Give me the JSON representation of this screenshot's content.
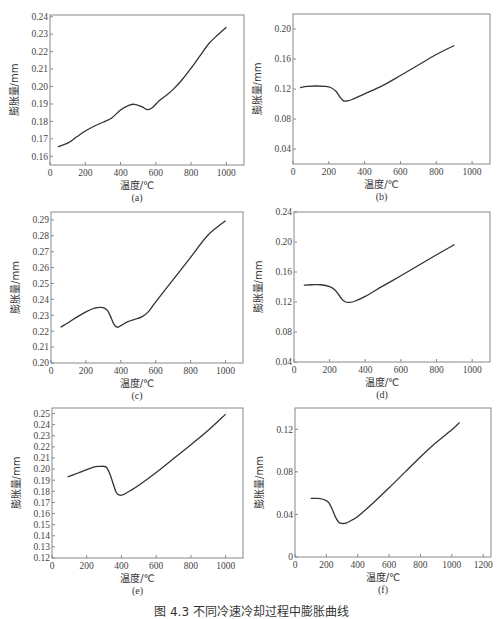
{
  "figure": {
    "caption": "图 4.3  不同冷速冷却过程中膨胀曲线"
  },
  "colors": {
    "line": "#333333",
    "frame": "#888888",
    "text": "#444444"
  },
  "chart_data": [
    {
      "id": "a",
      "type": "line",
      "sublabel": "(a)",
      "xlabel": "温度/℃",
      "ylabel": "膨胀量/mm",
      "xlim": [
        0,
        1100
      ],
      "ylim": [
        0.155,
        0.241
      ],
      "xticks": [
        0,
        200,
        400,
        600,
        800,
        1000
      ],
      "yticks": [
        0.16,
        0.17,
        0.18,
        0.19,
        0.2,
        0.21,
        0.22,
        0.23,
        0.24
      ],
      "ytick_labels": [
        "0.16",
        "0.17",
        "0.18",
        "0.19",
        "0.20",
        "0.21",
        "0.22",
        "0.23",
        "0.24"
      ],
      "frame": {
        "x": 50,
        "y": 15,
        "w": 194,
        "h": 150
      },
      "x": [
        45,
        100,
        150,
        200,
        250,
        300,
        350,
        400,
        450,
        480,
        520,
        550,
        580,
        620,
        660,
        700,
        750,
        800,
        850,
        900,
        950,
        1000
      ],
      "y": [
        0.1655,
        0.1675,
        0.171,
        0.1745,
        0.1772,
        0.1795,
        0.182,
        0.1865,
        0.1893,
        0.1898,
        0.1885,
        0.1868,
        0.1878,
        0.192,
        0.195,
        0.1985,
        0.204,
        0.2105,
        0.2175,
        0.2245,
        0.2295,
        0.234
      ]
    },
    {
      "id": "b",
      "type": "line",
      "sublabel": "(b)",
      "xlabel": "温度/℃",
      "ylabel": "膨胀量/mm",
      "xlim": [
        0,
        1100
      ],
      "ylim": [
        0.02,
        0.22
      ],
      "xticks": [
        0,
        200,
        400,
        600,
        800,
        1000
      ],
      "yticks": [
        0.04,
        0.08,
        0.12,
        0.16,
        0.2
      ],
      "ytick_labels": [
        "0.04",
        "0.08",
        "0.12",
        "0.16",
        "0.20"
      ],
      "frame": {
        "x": 293,
        "y": 14,
        "w": 197,
        "h": 150
      },
      "x": [
        40,
        80,
        130,
        180,
        210,
        240,
        260,
        280,
        300,
        330,
        400,
        500,
        600,
        700,
        800,
        900
      ],
      "y": [
        0.122,
        0.1235,
        0.124,
        0.1235,
        0.122,
        0.117,
        0.11,
        0.1045,
        0.104,
        0.106,
        0.1135,
        0.1245,
        0.138,
        0.152,
        0.166,
        0.178
      ]
    },
    {
      "id": "c",
      "type": "line",
      "sublabel": "(c)",
      "xlabel": "温度/℃",
      "ylabel": "膨胀量/mm",
      "xlim": [
        0,
        1100
      ],
      "ylim": [
        0.2,
        0.295
      ],
      "xticks": [
        0,
        200,
        400,
        600,
        800,
        1000
      ],
      "yticks": [
        0.2,
        0.21,
        0.22,
        0.23,
        0.24,
        0.25,
        0.26,
        0.27,
        0.28,
        0.29
      ],
      "ytick_labels": [
        "0.20",
        "0.21",
        "0.22",
        "0.23",
        "0.24",
        "0.25",
        "0.26",
        "0.27",
        "0.28",
        "0.29"
      ],
      "frame": {
        "x": 51,
        "y": 212,
        "w": 192,
        "h": 151
      },
      "x": [
        55,
        100,
        150,
        200,
        250,
        290,
        320,
        340,
        360,
        380,
        400,
        440,
        480,
        520,
        560,
        600,
        700,
        800,
        900,
        1000
      ],
      "y": [
        0.2225,
        0.2255,
        0.229,
        0.2322,
        0.2345,
        0.235,
        0.2335,
        0.2295,
        0.2245,
        0.2225,
        0.2235,
        0.226,
        0.2275,
        0.229,
        0.2325,
        0.2385,
        0.2525,
        0.2665,
        0.2805,
        0.2895
      ]
    },
    {
      "id": "d",
      "type": "line",
      "sublabel": "(d)",
      "xlabel": "温度/℃",
      "ylabel": "膨胀量/mm",
      "xlim": [
        0,
        1100
      ],
      "ylim": [
        0.04,
        0.24
      ],
      "xticks": [
        0,
        200,
        400,
        600,
        800,
        1000
      ],
      "yticks": [
        0.04,
        0.08,
        0.12,
        0.16,
        0.2,
        0.24
      ],
      "ytick_labels": [
        "0.04",
        "0.08",
        "0.12",
        "0.16",
        "0.20",
        "0.24"
      ],
      "frame": {
        "x": 294,
        "y": 212,
        "w": 196,
        "h": 150
      },
      "x": [
        55,
        100,
        150,
        200,
        230,
        250,
        270,
        290,
        310,
        340,
        400,
        500,
        600,
        700,
        800,
        900
      ],
      "y": [
        0.1425,
        0.143,
        0.143,
        0.1405,
        0.136,
        0.13,
        0.1235,
        0.12,
        0.1195,
        0.121,
        0.1275,
        0.1415,
        0.155,
        0.169,
        0.183,
        0.1965
      ]
    },
    {
      "id": "e",
      "type": "line",
      "sublabel": "(e)",
      "xlabel": "温度/℃",
      "ylabel": "膨胀量/mm",
      "xlim": [
        0,
        1100
      ],
      "ylim": [
        0.12,
        0.255
      ],
      "xticks": [
        0,
        200,
        400,
        600,
        800,
        1000
      ],
      "yticks": [
        0.12,
        0.13,
        0.14,
        0.15,
        0.16,
        0.17,
        0.18,
        0.19,
        0.2,
        0.21,
        0.22,
        0.23,
        0.24,
        0.25
      ],
      "ytick_labels": [
        "0.12",
        "0.13",
        "0.14",
        "0.15",
        "0.16",
        "0.17",
        "0.18",
        "0.19",
        "0.20",
        "0.21",
        "0.22",
        "0.23",
        "0.24",
        "0.25"
      ],
      "frame": {
        "x": 52,
        "y": 408,
        "w": 191,
        "h": 150
      },
      "x": [
        90,
        150,
        200,
        250,
        280,
        310,
        330,
        350,
        370,
        390,
        410,
        450,
        500,
        600,
        700,
        800,
        900,
        1000
      ],
      "y": [
        0.193,
        0.1965,
        0.1995,
        0.2022,
        0.2025,
        0.202,
        0.197,
        0.188,
        0.179,
        0.1765,
        0.177,
        0.1805,
        0.1855,
        0.197,
        0.2095,
        0.222,
        0.235,
        0.2495
      ]
    },
    {
      "id": "f",
      "type": "line",
      "sublabel": "(f)",
      "xlabel": "温度/℃",
      "ylabel": "膨胀量/mm",
      "xlim": [
        0,
        1250
      ],
      "ylim": [
        0,
        0.14
      ],
      "xticks": [
        0,
        200,
        400,
        600,
        800,
        1000,
        1200
      ],
      "yticks": [
        0,
        0.04,
        0.08,
        0.12
      ],
      "ytick_labels": [
        "0",
        "0.04",
        "0.08",
        "0.12"
      ],
      "frame": {
        "x": 295,
        "y": 408,
        "w": 196,
        "h": 149
      },
      "x": [
        100,
        150,
        200,
        220,
        240,
        260,
        280,
        300,
        330,
        360,
        400,
        500,
        600,
        700,
        800,
        900,
        1000,
        1050
      ],
      "y": [
        0.055,
        0.055,
        0.053,
        0.05,
        0.044,
        0.037,
        0.0325,
        0.0315,
        0.032,
        0.0345,
        0.038,
        0.051,
        0.065,
        0.0795,
        0.094,
        0.1075,
        0.1195,
        0.1265
      ]
    }
  ]
}
